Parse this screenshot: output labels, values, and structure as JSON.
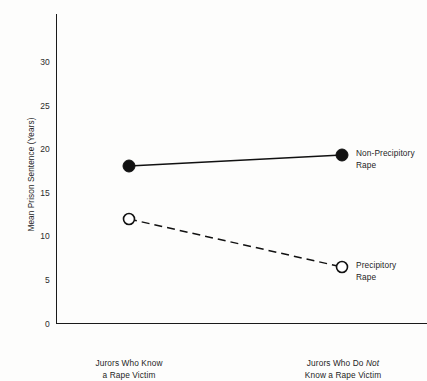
{
  "chart_data": {
    "type": "line",
    "title": "",
    "xlabel": "",
    "ylabel": "Mean Prison Sentence (Years)",
    "categories": [
      "Jurors Who Know\na Rape Victim",
      "Jurors Who Do Not\nKnow a Rape Victim"
    ],
    "category_labels_html": [
      "Jurors Who Know<br>a Rape Victim",
      "Jurors Who Do <em>Not</em><br>Know a Rape Victim"
    ],
    "series": [
      {
        "name": "Non-Precipitory Rape",
        "label": "Non-Precipitory\nRape",
        "values": [
          18.3,
          19.5
        ],
        "line_style": "solid",
        "marker": "filled-circle",
        "color": "#111111"
      },
      {
        "name": "Precipitory Rape",
        "label": "Precipitory\nRape",
        "values": [
          12.1,
          6.6
        ],
        "line_style": "dashed",
        "marker": "open-circle",
        "color": "#111111"
      }
    ],
    "ylim": [
      0,
      33
    ],
    "yticks": [
      0,
      5,
      10,
      15,
      20,
      25,
      30
    ],
    "ytick_labels": [
      "0",
      "5",
      "10",
      "15",
      "20",
      "25",
      "30"
    ],
    "grid": false,
    "legend_position": "inline-right"
  },
  "axes": {
    "y_axis_name": "y-axis",
    "x_axis_name": "x-axis"
  }
}
